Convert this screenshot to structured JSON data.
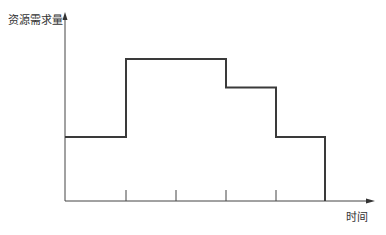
{
  "chart_data": {
    "type": "line",
    "subtype": "step",
    "title": "",
    "xlabel": "时间",
    "ylabel": "资源需求量",
    "x_tick_labels": [],
    "y_tick_labels": [],
    "grid": false,
    "legend": null,
    "x_breaks_px": [
      65,
      126,
      176,
      226,
      276,
      325
    ],
    "tick_marks_px": [
      126,
      176,
      226,
      276
    ],
    "segments": [
      {
        "x_start": 0,
        "x_end": 1,
        "value": 4.5
      },
      {
        "x_start": 1,
        "x_end": 3,
        "value": 10
      },
      {
        "x_start": 3,
        "x_end": 4,
        "value": 8
      },
      {
        "x_start": 4,
        "x_end": 5,
        "value": 4.5
      }
    ],
    "x": [
      0,
      1,
      2,
      3,
      4,
      5
    ],
    "values": [
      4.5,
      10,
      10,
      8,
      4.5,
      0
    ],
    "ylim": [
      0,
      13
    ],
    "xlim": [
      0,
      6
    ],
    "colors": {
      "line": "#3a3a3a",
      "axis": "#444444"
    }
  }
}
